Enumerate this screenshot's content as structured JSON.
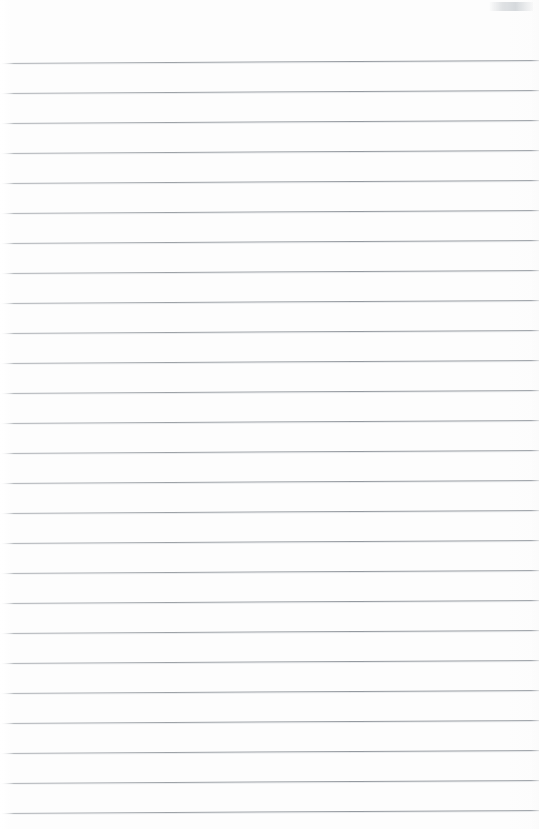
{
  "document": {
    "kind": "scanned-lined-paper",
    "title": "Blank ruled notebook page",
    "content_text": "",
    "handwriting_present": "no",
    "printed_text_present": "no",
    "page_number_visible": "",
    "page_width_px": 539,
    "page_height_px": 829
  },
  "colors": {
    "page_background": "#fdfdfd",
    "rule_line": "#9aa0a6",
    "rule_line_faint": "#cfd3d7",
    "edge_white": "#ffffff",
    "smudge_gray": "#d2d6da"
  },
  "ruling": {
    "style": "horizontal-ruled",
    "line_count": 26,
    "line_spacing_px": 30,
    "first_line_y_px": 63,
    "last_line_y_px": 813,
    "line_thickness_px": 1,
    "top_margin_px": 63,
    "left_margin_px": 4,
    "margin_rule_present": "no",
    "skew_degrees": -0.32,
    "lines_y": [
      63,
      93,
      123,
      153,
      183,
      213,
      243,
      273,
      303,
      333,
      363,
      393,
      423,
      453,
      483,
      513,
      543,
      573,
      603,
      633,
      663,
      693,
      723,
      753,
      783,
      813
    ]
  },
  "artifacts": {
    "left_edge_fade": "yes",
    "right_edge_fade": "yes",
    "top_right_smudge": "yes",
    "smudge_label": "scan-smudge"
  }
}
